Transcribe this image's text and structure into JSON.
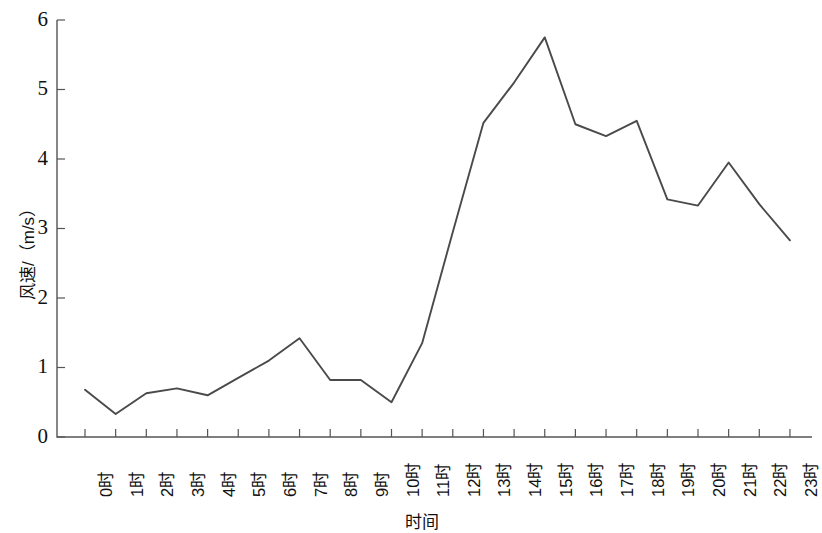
{
  "chart_data": {
    "type": "line",
    "title": "",
    "xlabel": "时间",
    "ylabel": "风速/（m/s）",
    "categories": [
      "0时",
      "1时",
      "2时",
      "3时",
      "4时",
      "5时",
      "6时",
      "7时",
      "8时",
      "9时",
      "10时",
      "11时",
      "12时",
      "13时",
      "14时",
      "15时",
      "16时",
      "17时",
      "18时",
      "19时",
      "20时",
      "21时",
      "22时",
      "23时"
    ],
    "values": [
      0.68,
      0.33,
      0.63,
      0.7,
      0.6,
      0.85,
      1.1,
      1.42,
      0.82,
      0.82,
      0.5,
      1.35,
      2.95,
      4.52,
      5.1,
      5.75,
      4.5,
      4.33,
      4.55,
      3.42,
      3.33,
      3.95,
      3.35,
      2.83
    ],
    "series": [
      {
        "name": "风速",
        "values": [
          0.68,
          0.33,
          0.63,
          0.7,
          0.6,
          0.85,
          1.1,
          1.42,
          0.82,
          0.82,
          0.5,
          1.35,
          2.95,
          4.52,
          5.1,
          5.75,
          4.5,
          4.33,
          4.55,
          3.42,
          3.33,
          3.95,
          3.35,
          2.83
        ]
      }
    ],
    "ylim": [
      0,
      6
    ],
    "yticks": [
      0,
      1,
      2,
      3,
      4,
      5,
      6
    ],
    "ytick_labels": [
      "0",
      "1",
      "2",
      "3",
      "4",
      "5",
      "6"
    ],
    "grid": false,
    "legend": null,
    "line_color": "#4a4a4a",
    "axis_color": "#555555"
  }
}
